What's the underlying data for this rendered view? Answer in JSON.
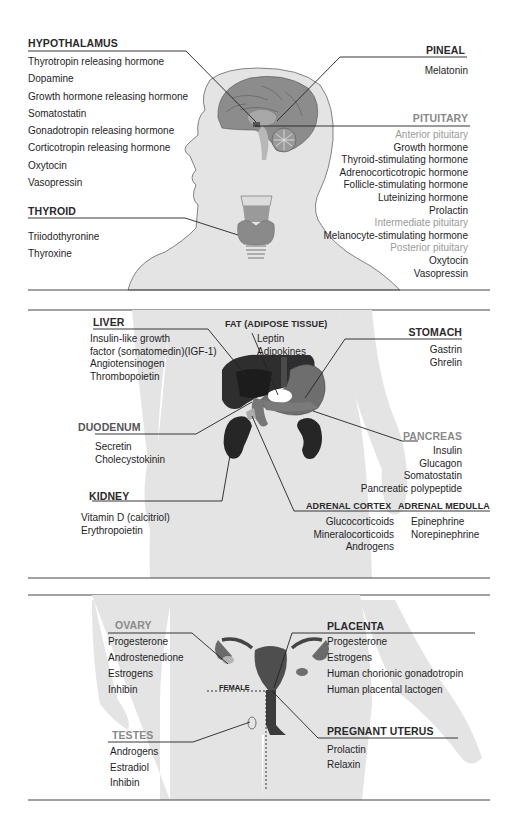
{
  "sections": {
    "head": {
      "hypothalamus": {
        "title": "HYPOTHALAMUS",
        "items": [
          "Thyrotropin releasing hormone",
          "Dopamine",
          "Growth hormone releasing hormone",
          "Somatostatin",
          "Gonadotropin releasing hormone",
          "Corticotropin releasing hormone",
          "Oxytocin",
          "Vasopressin"
        ]
      },
      "pineal": {
        "title": "PINEAL",
        "items": [
          "Melatonin"
        ]
      },
      "pituitary": {
        "title": "PITUITARY",
        "groups": [
          {
            "label": "Anterior pituitary",
            "items": [
              "Growth hormone",
              "Thyroid-stimulating hormone",
              "Adrenocorticotropic hormone",
              "Follicle-stimulating hormone",
              "Luteinizing hormone",
              "Prolactin"
            ]
          },
          {
            "label": "Intermediate pituitary",
            "items": [
              "Melanocyte-stimulating hormone"
            ]
          },
          {
            "label": "Posterior pituitary",
            "items": [
              "Oxytocin",
              "Vasopressin"
            ]
          }
        ]
      },
      "thyroid": {
        "title": "THYROID",
        "items": [
          "Triiodothyronine",
          "Thyroxine"
        ]
      }
    },
    "abdomen": {
      "liver": {
        "title": "LIVER",
        "items": [
          "Insulin-like growth",
          "factor (somatomedin)(IGF-1)",
          "Angiotensinogen",
          "Thrombopoietin"
        ]
      },
      "fat": {
        "title": "FAT (ADIPOSE TISSUE)",
        "items": [
          "Leptin",
          "Adipokines"
        ]
      },
      "stomach": {
        "title": "STOMACH",
        "items": [
          "Gastrin",
          "Ghrelin"
        ]
      },
      "duodenum": {
        "title": "DUODENUM",
        "items": [
          "Secretin",
          "Cholecystokinin"
        ]
      },
      "pancreas": {
        "title": "PANCREAS",
        "items": [
          "Insulin",
          "Glucagon",
          "Somatostatin",
          "Pancreatic polypeptide"
        ]
      },
      "kidney": {
        "title": "KIDNEY",
        "items": [
          "Vitamin D (calcitriol)",
          "Erythropoietin"
        ]
      },
      "adrenal_cortex": {
        "title": "ADRENAL CORTEX",
        "items": [
          "Glucocorticoids",
          "Mineralocorticoids",
          "Androgens"
        ]
      },
      "adrenal_medulla": {
        "title": "ADRENAL MEDULLA",
        "items": [
          "Epinephrine",
          "Norepinephrine"
        ]
      }
    },
    "pelvis": {
      "ovary": {
        "title": "OVARY",
        "items": [
          "Progesterone",
          "Androstenedione",
          "Estrogens",
          "Inhibin"
        ]
      },
      "placenta": {
        "title": "PLACENTA",
        "items": [
          "Progesterone",
          "Estrogens",
          "Human chorionic gonadotropin",
          "Human placental lactogen"
        ]
      },
      "female_label": "FEMALE",
      "testes": {
        "title": "TESTES",
        "items": [
          "Androgens",
          "Estradiol",
          "Inhibin"
        ]
      },
      "pregnant_uterus": {
        "title": "PREGNANT UTERUS",
        "items": [
          "Prolactin",
          "Relaxin"
        ]
      }
    }
  },
  "colors": {
    "silhouette": "#e4e4e4",
    "brain": "#8c8c8c",
    "organ_dark": "#2e2e2e",
    "organ_mid": "#6e6e6e",
    "gray_label": "#8a8a8a",
    "rule": "#333333"
  }
}
